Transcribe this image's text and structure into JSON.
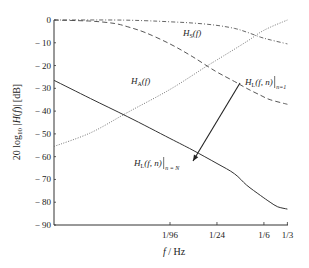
{
  "chart_data": {
    "type": "line",
    "title": "",
    "xlabel": "f / Hz",
    "ylabel": "20 log10 |H(f)| [dB]",
    "xscale": "log",
    "xlim": [
      0.00034,
      0.3333
    ],
    "ylim": [
      -90,
      0
    ],
    "grid": false,
    "legend": "none (inline annotations)",
    "x_ticks": [
      {
        "label": "1/96",
        "value": 0.0104167
      },
      {
        "label": "1/24",
        "value": 0.0416667
      },
      {
        "label": "1/6",
        "value": 0.1666667
      },
      {
        "label": "1/3",
        "value": 0.3333333
      }
    ],
    "y_ticks": [
      0,
      -10,
      -20,
      -30,
      -40,
      -50,
      -60,
      -70,
      -80,
      -90
    ],
    "y_tick_labels": [
      "0",
      "− 10",
      "− 20",
      "− 30",
      "− 40",
      "− 50",
      "− 60",
      "− 70",
      "− 80",
      "− 90"
    ],
    "series": [
      {
        "name": "H_S(f)",
        "style": "dash-dot",
        "x": [
          0.00034,
          0.002,
          0.005,
          0.0104,
          0.02,
          0.04,
          0.07,
          0.1,
          0.15,
          0.2,
          0.3333
        ],
        "values": [
          0,
          0,
          -0.3,
          -0.8,
          -1.3,
          -2.3,
          -3.7,
          -5.3,
          -7.5,
          -8.7,
          -10.5
        ]
      },
      {
        "name": "H_A(f)",
        "style": "dotted",
        "x": [
          0.00034,
          0.001,
          0.003,
          0.0104,
          0.03,
          0.0417,
          0.1,
          0.1667,
          0.3333
        ],
        "values": [
          -55.5,
          -49.5,
          -40.5,
          -30.5,
          -20.5,
          -17.5,
          -9.5,
          -4.5,
          0
        ]
      },
      {
        "name": "H_L(f,n)|n=1",
        "style": "dashed",
        "x": [
          0.00034,
          0.001,
          0.002,
          0.003,
          0.005,
          0.0104,
          0.02,
          0.04,
          0.07,
          0.1,
          0.15,
          0.2,
          0.3333
        ],
        "values": [
          0,
          -0.5,
          -1.5,
          -3,
          -5.5,
          -10.5,
          -16,
          -22.5,
          -27,
          -30,
          -33,
          -35,
          -37
        ]
      },
      {
        "name": "H_L(f,n)|n=N",
        "style": "solid",
        "x": [
          0.00034,
          0.001,
          0.003,
          0.0104,
          0.02,
          0.0417,
          0.07,
          0.1,
          0.15,
          0.2,
          0.25,
          0.3333
        ],
        "values": [
          -26.5,
          -34.5,
          -42.5,
          -52,
          -57,
          -63,
          -67.5,
          -72.5,
          -77,
          -80,
          -82,
          -83
        ]
      }
    ],
    "annotations": [
      {
        "id": "hs",
        "base": "H",
        "sub": "S",
        "tail": "(f)",
        "cond": "",
        "x_px": 183,
        "y_px": 36
      },
      {
        "id": "ha",
        "base": "H",
        "sub": "A",
        "tail": "(f)",
        "cond": "",
        "x_px": 131,
        "y_px": 84
      },
      {
        "id": "hl1",
        "base": "H",
        "sub": "L",
        "tail": "(f, n)",
        "cond": "n=1",
        "x_px": 245,
        "y_px": 85
      },
      {
        "id": "hln",
        "base": "H",
        "sub": "L",
        "tail": "(f, n)",
        "cond": "n = N",
        "x_px": 134,
        "y_px": 166
      }
    ],
    "arrow": {
      "from_px": [
        240,
        83
      ],
      "to_px": [
        193,
        161
      ],
      "meaning": "from n=1 to n=N"
    }
  },
  "plot": {
    "left_px": 54,
    "right_px": 288,
    "top_px": 20,
    "bottom_px": 225,
    "ref_tick_px": 170,
    "ref_tick_log10": -1.98227,
    "px_per_decade": 78.0
  }
}
